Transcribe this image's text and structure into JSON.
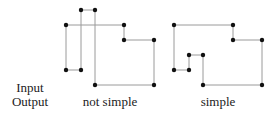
{
  "labels": {
    "input": "Input",
    "output": "Output",
    "left_caption": "not simple",
    "right_caption": "simple"
  },
  "colors": {
    "edge": "#9a9a9a",
    "vertex": "#111111",
    "text": "#222222"
  },
  "diagrams": [
    {
      "name": "not-simple-polygon",
      "caption": "not simple",
      "vertices": [
        [
          81,
          10
        ],
        [
          95,
          10
        ],
        [
          95,
          85
        ],
        [
          154,
          85
        ],
        [
          154,
          40
        ],
        [
          124,
          40
        ],
        [
          124,
          25
        ],
        [
          66,
          25
        ],
        [
          66,
          70
        ],
        [
          81,
          70
        ]
      ],
      "closed": true
    },
    {
      "name": "simple-polygon",
      "caption": "simple",
      "vertices": [
        [
          174,
          25
        ],
        [
          233,
          25
        ],
        [
          233,
          40
        ],
        [
          262,
          40
        ],
        [
          262,
          85
        ],
        [
          203,
          85
        ],
        [
          203,
          55
        ],
        [
          189,
          55
        ],
        [
          189,
          70
        ],
        [
          174,
          70
        ]
      ],
      "closed": true
    }
  ]
}
